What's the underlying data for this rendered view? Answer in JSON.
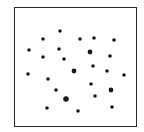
{
  "chart_data": {
    "type": "scatter",
    "title": "",
    "xlabel": "",
    "ylabel": "",
    "axes": false,
    "grid": false,
    "legend": null,
    "frame": {
      "x": 14,
      "y": 7,
      "width": 123,
      "height": 120,
      "color": "#2a2a2a"
    },
    "dot_color": "#1a1a1a",
    "count": 25,
    "points": [
      {
        "x": 60,
        "y": 31,
        "r": 1.8
      },
      {
        "x": 43,
        "y": 39,
        "r": 1.8
      },
      {
        "x": 80,
        "y": 39,
        "r": 1.8
      },
      {
        "x": 94,
        "y": 38,
        "r": 1.8
      },
      {
        "x": 114,
        "y": 40,
        "r": 1.8
      },
      {
        "x": 29,
        "y": 50,
        "r": 1.8
      },
      {
        "x": 59,
        "y": 49,
        "r": 1.8
      },
      {
        "x": 90,
        "y": 52,
        "r": 2.4
      },
      {
        "x": 43,
        "y": 57,
        "r": 1.8
      },
      {
        "x": 64,
        "y": 59,
        "r": 1.8
      },
      {
        "x": 110,
        "y": 56,
        "r": 1.8
      },
      {
        "x": 93,
        "y": 66,
        "r": 1.8
      },
      {
        "x": 74,
        "y": 71,
        "r": 2.4
      },
      {
        "x": 107,
        "y": 71,
        "r": 1.8
      },
      {
        "x": 28,
        "y": 74,
        "r": 1.8
      },
      {
        "x": 124,
        "y": 75,
        "r": 1.8
      },
      {
        "x": 48,
        "y": 79,
        "r": 1.8
      },
      {
        "x": 91,
        "y": 84,
        "r": 1.8
      },
      {
        "x": 56,
        "y": 90,
        "r": 1.8
      },
      {
        "x": 111,
        "y": 90,
        "r": 2.4
      },
      {
        "x": 95,
        "y": 96,
        "r": 1.8
      },
      {
        "x": 66,
        "y": 99,
        "r": 2.8
      },
      {
        "x": 47,
        "y": 108,
        "r": 1.8
      },
      {
        "x": 112,
        "y": 107,
        "r": 1.8
      },
      {
        "x": 78,
        "y": 111,
        "r": 1.8
      }
    ]
  }
}
